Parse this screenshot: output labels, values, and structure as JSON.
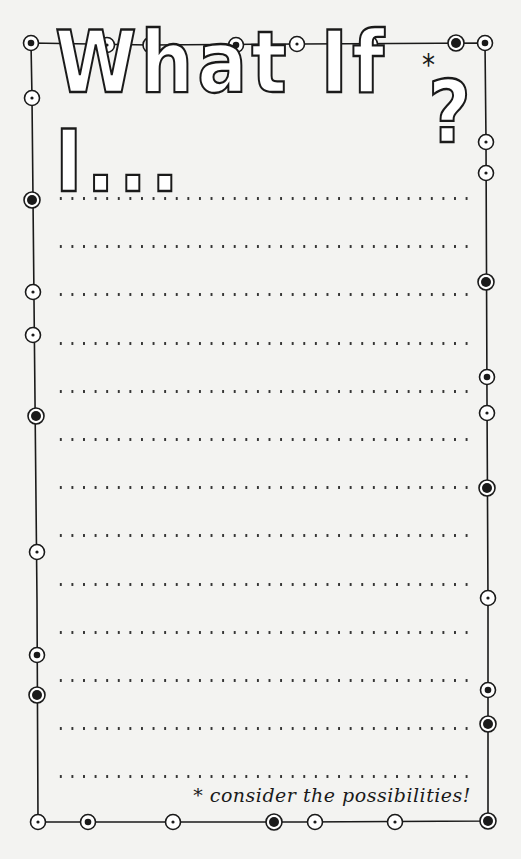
{
  "notepad": {
    "title": "What If I...?",
    "title_main": "What If I...",
    "title_mark": "?",
    "title_asterisk": "*",
    "footer_note": "* consider the possibilities!",
    "line_count": 13,
    "colors": {
      "ink": "#1a1a1a",
      "paper": "#f3f3f1"
    }
  },
  "border": {
    "top_circles": [
      {
        "x": 31,
        "y": 43,
        "style": "filled-dot"
      },
      {
        "x": 107,
        "y": 45,
        "style": "small-dot"
      },
      {
        "x": 151,
        "y": 45,
        "style": "filled-large"
      },
      {
        "x": 236,
        "y": 45,
        "style": "filled-dot"
      },
      {
        "x": 297,
        "y": 44,
        "style": "small-dot"
      },
      {
        "x": 370,
        "y": 44,
        "style": "small-dot"
      },
      {
        "x": 456,
        "y": 43,
        "style": "filled-large"
      },
      {
        "x": 485,
        "y": 43,
        "style": "filled-dot"
      }
    ],
    "left_circles": [
      {
        "x": 32,
        "y": 98,
        "style": "small-dot"
      },
      {
        "x": 32,
        "y": 200,
        "style": "filled-large"
      },
      {
        "x": 33,
        "y": 292,
        "style": "small-dot"
      },
      {
        "x": 33,
        "y": 335,
        "style": "small-dot"
      },
      {
        "x": 36,
        "y": 416,
        "style": "filled-large"
      },
      {
        "x": 37,
        "y": 552,
        "style": "small-dot"
      },
      {
        "x": 37,
        "y": 655,
        "style": "filled-dot"
      },
      {
        "x": 37,
        "y": 695,
        "style": "filled-large"
      }
    ],
    "right_circles": [
      {
        "x": 486,
        "y": 142,
        "style": "small-dot"
      },
      {
        "x": 486,
        "y": 173,
        "style": "small-dot"
      },
      {
        "x": 486,
        "y": 282,
        "style": "filled-large"
      },
      {
        "x": 487,
        "y": 377,
        "style": "filled-dot"
      },
      {
        "x": 487,
        "y": 413,
        "style": "small-dot"
      },
      {
        "x": 487,
        "y": 488,
        "style": "filled-large"
      },
      {
        "x": 488,
        "y": 598,
        "style": "small-dot"
      },
      {
        "x": 488,
        "y": 690,
        "style": "filled-dot"
      },
      {
        "x": 488,
        "y": 724,
        "style": "filled-large"
      }
    ],
    "bottom_circles": [
      {
        "x": 38,
        "y": 822,
        "style": "small-dot"
      },
      {
        "x": 88,
        "y": 822,
        "style": "filled-dot"
      },
      {
        "x": 173,
        "y": 822,
        "style": "small-dot"
      },
      {
        "x": 274,
        "y": 822,
        "style": "filled-large"
      },
      {
        "x": 315,
        "y": 822,
        "style": "small-dot"
      },
      {
        "x": 395,
        "y": 822,
        "style": "small-dot"
      },
      {
        "x": 488,
        "y": 821,
        "style": "filled-large"
      }
    ]
  }
}
